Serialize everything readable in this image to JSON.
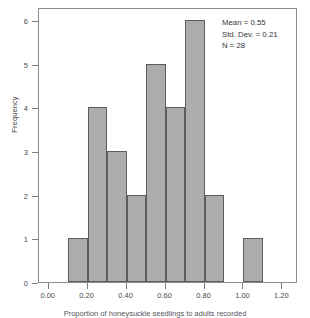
{
  "chart_data": {
    "type": "bar",
    "title": "",
    "xlabel": "Proportion of honeysuckle seedlings to adults recorded",
    "ylabel": "Frequency",
    "bin_width": 0.1,
    "bin_starts": [
      0.1,
      0.2,
      0.3,
      0.4,
      0.5,
      0.6,
      0.7,
      0.8,
      0.9,
      1.0
    ],
    "categories": [
      "0.10-0.20",
      "0.20-0.30",
      "0.30-0.40",
      "0.40-0.50",
      "0.50-0.60",
      "0.60-0.70",
      "0.70-0.80",
      "0.80-0.90",
      "0.90-1.00",
      "1.00-1.10"
    ],
    "values": [
      1,
      4,
      3,
      2,
      5,
      4,
      6,
      2,
      0,
      1
    ],
    "xlim": [
      -0.05,
      1.28
    ],
    "ylim": [
      0,
      6.3
    ],
    "xticks": [
      0.0,
      0.2,
      0.4,
      0.6,
      0.8,
      1.0,
      1.2
    ],
    "xtick_labels": [
      "0.00",
      "0.20",
      "0.40",
      "0.60",
      "0.80",
      "1.00",
      "1.20"
    ],
    "yticks": [
      0,
      1,
      2,
      3,
      4,
      5,
      6
    ],
    "ytick_labels": [
      "0",
      "1",
      "2",
      "3",
      "4",
      "5",
      "6"
    ],
    "grid": false,
    "legend": "none",
    "bar_color": "#acacac",
    "bar_edge_color": "#5c5c5c",
    "frame_color": "#8c8c8c"
  },
  "annotation": {
    "mean": "Mean = 0.55",
    "std_dev": "Std. Dev. = 0.21",
    "n": "N = 28"
  },
  "axes": {
    "y_title": "Frequency"
  },
  "caption": {
    "text": "Proportion of honeysuckle seedlings to adults recorded"
  }
}
